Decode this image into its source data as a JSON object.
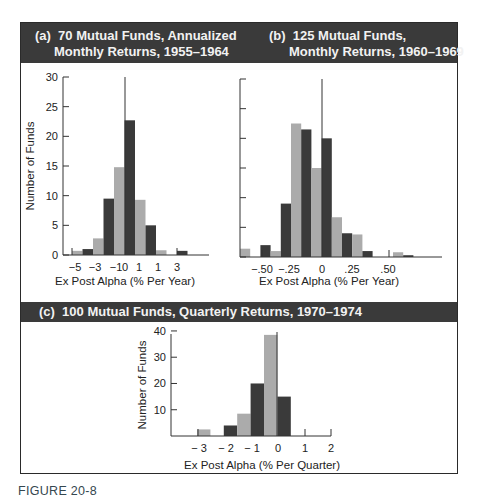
{
  "panels": {
    "a": {
      "title_line1": "(a)  70 Mutual Funds, Annualized",
      "title_line2": "Monthly Returns, 1955–1964"
    },
    "b": {
      "title_line1": "(b)  125 Mutual Funds,",
      "title_line2": "Monthly Returns, 1960–1969"
    },
    "c": {
      "title": "(c)  100 Mutual Funds, Quarterly Returns, 1970–1974"
    }
  },
  "figure_label": "FIGURE 20-8",
  "colors": {
    "header_bg": "#3a3a3a",
    "header_text": "#f2f2f2",
    "bar_dark": "#3a3a3a",
    "bar_light": "#ababab",
    "figure_label": "#35474f"
  },
  "chart_data": [
    {
      "type": "bar",
      "title": "(a) 70 Mutual Funds, Annualized Monthly Returns, 1955–1964",
      "xlabel": "Ex Post Alpha (% Per Year)",
      "ylabel": "Number of Funds",
      "ylim": [
        0,
        30
      ],
      "yticks": [
        "0",
        "5",
        "10",
        "15",
        "20",
        "25",
        "30"
      ],
      "xtick_labels": [
        "−5",
        "−3",
        "−1",
        "0",
        "1",
        "1",
        "3"
      ],
      "grid": false,
      "legend": null,
      "bars": [
        {
          "shade": "light",
          "value": 0.7
        },
        {
          "shade": "dark",
          "value": 1
        },
        {
          "shade": "light",
          "value": 2.8
        },
        {
          "shade": "dark",
          "value": 9.5
        },
        {
          "shade": "light",
          "value": 14.8
        },
        {
          "shade": "dark",
          "value": 22.7
        },
        {
          "shade": "light",
          "value": 9.3
        },
        {
          "shade": "dark",
          "value": 5
        },
        {
          "shade": "light",
          "value": 0.8
        },
        {
          "shade": "none",
          "value": 0
        },
        {
          "shade": "dark",
          "value": 0.7
        }
      ]
    },
    {
      "type": "bar",
      "title": "(b) 125 Mutual Funds, Monthly Returns, 1960–1969",
      "xlabel": "Ex Post Alpha (% Per Year)",
      "ylabel": "",
      "ylim": [
        0,
        30
      ],
      "yticks": [
        "0",
        "5",
        "10",
        "15",
        "20",
        "25",
        "30"
      ],
      "xtick_labels": [
        "−.50",
        "−.25",
        "0",
        ".25",
        ".50"
      ],
      "grid": false,
      "legend": null,
      "bars": [
        {
          "shade": "light",
          "value": 1.4
        },
        {
          "shade": "none",
          "value": 0
        },
        {
          "shade": "dark",
          "value": 2
        },
        {
          "shade": "light",
          "value": 1
        },
        {
          "shade": "dark",
          "value": 9
        },
        {
          "shade": "light",
          "value": 22.5
        },
        {
          "shade": "dark",
          "value": 21.5
        },
        {
          "shade": "light",
          "value": 15
        },
        {
          "shade": "dark",
          "value": 20
        },
        {
          "shade": "light",
          "value": 6.7
        },
        {
          "shade": "dark",
          "value": 4
        },
        {
          "shade": "light",
          "value": 3.8
        },
        {
          "shade": "dark",
          "value": 1
        },
        {
          "shade": "none",
          "value": 0
        },
        {
          "shade": "none",
          "value": 0
        },
        {
          "shade": "light",
          "value": 0.8
        },
        {
          "shade": "dark",
          "value": 0.3
        }
      ]
    },
    {
      "type": "bar",
      "title": "(c) 100 Mutual Funds, Quarterly Returns, 1970–1974",
      "xlabel": "Ex Post Alpha (% Per Quarter)",
      "ylabel": "Number of Funds",
      "ylim": [
        0,
        40
      ],
      "yticks": [
        "10",
        "20",
        "30",
        "40"
      ],
      "xtick_labels": [
        "− 3",
        "− 2",
        "− 1",
        "0",
        "1",
        "2"
      ],
      "grid": false,
      "legend": null,
      "bars": [
        {
          "shade": "light",
          "value": 2.5
        },
        {
          "shade": "none",
          "value": 0
        },
        {
          "shade": "dark",
          "value": 4
        },
        {
          "shade": "light",
          "value": 8.5
        },
        {
          "shade": "dark",
          "value": 20
        },
        {
          "shade": "light",
          "value": 38.5
        },
        {
          "shade": "dark",
          "value": 15
        }
      ]
    }
  ]
}
